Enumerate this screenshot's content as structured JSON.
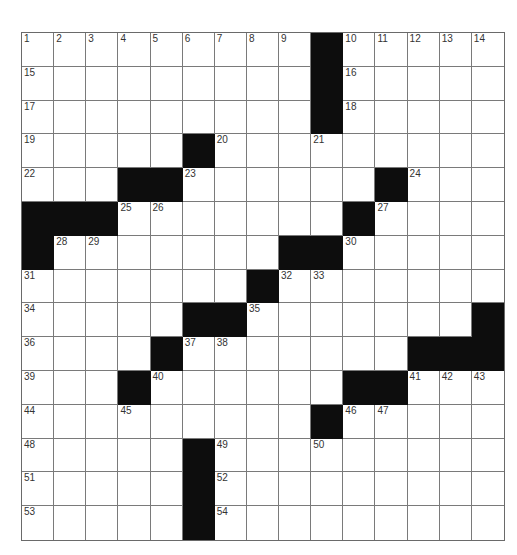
{
  "puzzle": {
    "rows": 15,
    "cols": 15,
    "pattern": [
      ".........#.....",
      ".........#.....",
      ".........#.....",
      ".....#.........",
      "...##......#...",
      "###.......#....",
      "#.......##.....",
      ".......#.......",
      ".....##.......#",
      "....#.......###",
      "...#......##...",
      ".........#.....",
      ".....#.........",
      ".....#.........",
      ".....#........."
    ],
    "numbers": [
      {
        "r": 0,
        "c": 0,
        "n": "1"
      },
      {
        "r": 0,
        "c": 1,
        "n": "2"
      },
      {
        "r": 0,
        "c": 2,
        "n": "3"
      },
      {
        "r": 0,
        "c": 3,
        "n": "4"
      },
      {
        "r": 0,
        "c": 4,
        "n": "5"
      },
      {
        "r": 0,
        "c": 5,
        "n": "6"
      },
      {
        "r": 0,
        "c": 6,
        "n": "7"
      },
      {
        "r": 0,
        "c": 7,
        "n": "8"
      },
      {
        "r": 0,
        "c": 8,
        "n": "9"
      },
      {
        "r": 0,
        "c": 10,
        "n": "10"
      },
      {
        "r": 0,
        "c": 11,
        "n": "11"
      },
      {
        "r": 0,
        "c": 12,
        "n": "12"
      },
      {
        "r": 0,
        "c": 13,
        "n": "13"
      },
      {
        "r": 0,
        "c": 14,
        "n": "14"
      },
      {
        "r": 1,
        "c": 0,
        "n": "15"
      },
      {
        "r": 1,
        "c": 10,
        "n": "16"
      },
      {
        "r": 2,
        "c": 0,
        "n": "17"
      },
      {
        "r": 2,
        "c": 10,
        "n": "18"
      },
      {
        "r": 3,
        "c": 0,
        "n": "19"
      },
      {
        "r": 3,
        "c": 6,
        "n": "20"
      },
      {
        "r": 3,
        "c": 9,
        "n": "21"
      },
      {
        "r": 4,
        "c": 0,
        "n": "22"
      },
      {
        "r": 4,
        "c": 5,
        "n": "23"
      },
      {
        "r": 4,
        "c": 12,
        "n": "24"
      },
      {
        "r": 5,
        "c": 3,
        "n": "25"
      },
      {
        "r": 5,
        "c": 4,
        "n": "26"
      },
      {
        "r": 5,
        "c": 11,
        "n": "27"
      },
      {
        "r": 6,
        "c": 1,
        "n": "28"
      },
      {
        "r": 6,
        "c": 2,
        "n": "29"
      },
      {
        "r": 6,
        "c": 10,
        "n": "30"
      },
      {
        "r": 7,
        "c": 0,
        "n": "31"
      },
      {
        "r": 7,
        "c": 8,
        "n": "32"
      },
      {
        "r": 7,
        "c": 9,
        "n": "33"
      },
      {
        "r": 8,
        "c": 0,
        "n": "34"
      },
      {
        "r": 8,
        "c": 7,
        "n": "35"
      },
      {
        "r": 9,
        "c": 0,
        "n": "36"
      },
      {
        "r": 9,
        "c": 5,
        "n": "37"
      },
      {
        "r": 9,
        "c": 6,
        "n": "38"
      },
      {
        "r": 10,
        "c": 0,
        "n": "39"
      },
      {
        "r": 10,
        "c": 4,
        "n": "40"
      },
      {
        "r": 10,
        "c": 12,
        "n": "41"
      },
      {
        "r": 10,
        "c": 13,
        "n": "42"
      },
      {
        "r": 10,
        "c": 14,
        "n": "43"
      },
      {
        "r": 11,
        "c": 0,
        "n": "44"
      },
      {
        "r": 11,
        "c": 3,
        "n": "45"
      },
      {
        "r": 11,
        "c": 10,
        "n": "46"
      },
      {
        "r": 11,
        "c": 11,
        "n": "47"
      },
      {
        "r": 12,
        "c": 0,
        "n": "48"
      },
      {
        "r": 12,
        "c": 6,
        "n": "49"
      },
      {
        "r": 12,
        "c": 9,
        "n": "50"
      },
      {
        "r": 13,
        "c": 0,
        "n": "51"
      },
      {
        "r": 13,
        "c": 6,
        "n": "52"
      },
      {
        "r": 14,
        "c": 0,
        "n": "53"
      },
      {
        "r": 14,
        "c": 6,
        "n": "54"
      }
    ],
    "colors": {
      "black_square": "#0d0d0d",
      "grid_line": "#7a7a7a",
      "number": "#333333"
    }
  }
}
